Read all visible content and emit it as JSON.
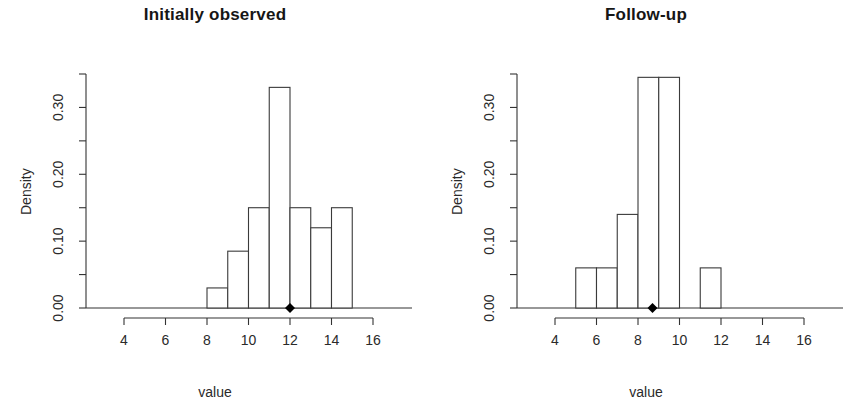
{
  "figure": {
    "panels": [
      {
        "title": "Initially observed",
        "xlabel": "value",
        "ylabel": "Density"
      },
      {
        "title": "Follow-up",
        "xlabel": "value",
        "ylabel": "Density"
      }
    ]
  },
  "chart_data": [
    {
      "type": "bar",
      "subtype": "histogram",
      "title": "Initially observed",
      "xlabel": "value",
      "ylabel": "Density",
      "xlim": [
        3,
        17
      ],
      "ylim": [
        0.0,
        0.35
      ],
      "xticks": [
        4,
        6,
        8,
        10,
        12,
        14,
        16
      ],
      "xtick_labels": [
        "4",
        "6",
        "8",
        "10",
        "12",
        "14",
        "16"
      ],
      "yticks": [
        0.0,
        0.05,
        0.1,
        0.15,
        0.2,
        0.25,
        0.3,
        0.35
      ],
      "ytick_labels": [
        "0.00",
        "",
        "0.10",
        "",
        "0.20",
        "",
        "0.30",
        ""
      ],
      "grid": false,
      "legend": null,
      "bin_width": 1,
      "bin_edges": [
        8,
        9,
        10,
        11,
        12,
        13,
        14,
        15
      ],
      "categories": [
        "8-9",
        "9-10",
        "10-11",
        "11-12",
        "12-13",
        "13-14",
        "14-15"
      ],
      "values": [
        0.03,
        0.085,
        0.15,
        0.33,
        0.15,
        0.12,
        0.15
      ],
      "annotations": [
        {
          "name": "median-marker",
          "shape": "filled-diamond",
          "x": 12,
          "y": 0.0
        }
      ]
    },
    {
      "type": "bar",
      "subtype": "histogram",
      "title": "Follow-up",
      "xlabel": "value",
      "ylabel": "Density",
      "xlim": [
        3,
        17
      ],
      "ylim": [
        0.0,
        0.35
      ],
      "xticks": [
        4,
        6,
        8,
        10,
        12,
        14,
        16
      ],
      "xtick_labels": [
        "4",
        "6",
        "8",
        "10",
        "12",
        "14",
        "16"
      ],
      "yticks": [
        0.0,
        0.05,
        0.1,
        0.15,
        0.2,
        0.25,
        0.3,
        0.35
      ],
      "ytick_labels": [
        "0.00",
        "",
        "0.10",
        "",
        "0.20",
        "",
        "0.30",
        ""
      ],
      "grid": false,
      "legend": null,
      "bin_width": 1,
      "bin_edges": [
        5,
        6,
        7,
        8,
        9,
        10,
        11,
        12
      ],
      "categories": [
        "5-6",
        "6-7",
        "7-8",
        "8-9",
        "9-10",
        "10-11",
        "11-12"
      ],
      "values": [
        0.06,
        0.06,
        0.14,
        0.345,
        0.345,
        0.0,
        0.06
      ],
      "annotations": [
        {
          "name": "median-marker",
          "shape": "filled-diamond",
          "x": 8.7,
          "y": 0.0
        }
      ]
    }
  ],
  "style": {
    "axis_color": "#333333",
    "bar_border_color": "#3a3a3a",
    "bar_fill": "#ffffff",
    "marker_color": "#000000",
    "text_color": "#2a2a2a"
  }
}
